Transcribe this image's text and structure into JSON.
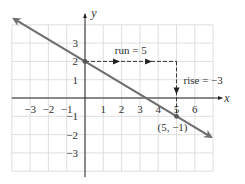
{
  "chart_data": {
    "type": "line",
    "title": "",
    "xlabel": "x",
    "ylabel": "y",
    "xlim": [
      -4,
      7
    ],
    "ylim": [
      -4,
      4
    ],
    "grid": true,
    "x_ticks": [
      "-3",
      "-2",
      "-1",
      "1",
      "2",
      "3",
      "4",
      "5",
      "6"
    ],
    "x_tick_values": [
      -3,
      -2,
      -1,
      1,
      2,
      3,
      4,
      5,
      6
    ],
    "y_ticks": [
      "3",
      "2",
      "1",
      "-1",
      "-2",
      "-3"
    ],
    "y_tick_values": [
      3,
      2,
      1,
      -1,
      -2,
      -3
    ],
    "line": {
      "slope": -0.6,
      "intercept": 2,
      "x_range": [
        -3.9,
        6.9
      ],
      "color": "#6f6f6f"
    },
    "points": [
      {
        "x": 0,
        "y": 2,
        "label": ""
      },
      {
        "x": 5,
        "y": -1,
        "label": "(5, −1)"
      }
    ],
    "annotations": [
      {
        "type": "run",
        "from": [
          0,
          2
        ],
        "to": [
          5,
          2
        ],
        "label": "run = 5"
      },
      {
        "type": "rise",
        "from": [
          5,
          2
        ],
        "to": [
          5,
          -1
        ],
        "label": "rise = −3"
      }
    ]
  }
}
